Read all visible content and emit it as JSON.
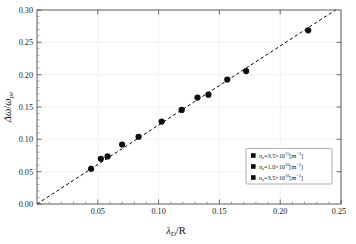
{
  "chart_data": {
    "type": "scatter",
    "title": "",
    "subtitle": "",
    "xlabel": "λ_D/R",
    "ylabel": "Δω/ω_pe",
    "xlim": [
      0.0,
      0.25
    ],
    "ylim": [
      0.0,
      0.3
    ],
    "xticks": [
      "0.05",
      "0.10",
      "0.15",
      "0.20",
      "0.25"
    ],
    "xtick_values": [
      0.05,
      0.1,
      0.15,
      0.2,
      0.25
    ],
    "yticks": [
      "0.00",
      "0.05",
      "0.10",
      "0.15",
      "0.20",
      "0.25",
      "0.30"
    ],
    "ytick_values": [
      0.0,
      0.05,
      0.1,
      0.15,
      0.2,
      0.25,
      0.3
    ],
    "grid": true,
    "legend_position": "lower-right",
    "points": [
      {
        "x": 0.0445,
        "y": 0.0545
      },
      {
        "x": 0.0525,
        "y": 0.07
      },
      {
        "x": 0.058,
        "y": 0.0735
      },
      {
        "x": 0.07,
        "y": 0.092
      },
      {
        "x": 0.0835,
        "y": 0.104
      },
      {
        "x": 0.1025,
        "y": 0.1275
      },
      {
        "x": 0.119,
        "y": 0.1455
      },
      {
        "x": 0.132,
        "y": 0.1645
      },
      {
        "x": 0.141,
        "y": 0.169
      },
      {
        "x": 0.1565,
        "y": 0.1925
      },
      {
        "x": 0.172,
        "y": 0.2055
      },
      {
        "x": 0.223,
        "y": 0.2685
      }
    ],
    "fit_line": {
      "style": "dashed",
      "x_start": 0.0,
      "y_start": 0.0,
      "x_end": 0.2455,
      "y_end": 0.3
    },
    "series": [
      {
        "name": "n_e=3.5×10^15 [m^-3]",
        "symbol": "n",
        "subscript": "e",
        "equals": "=3.5×10",
        "exponent": "15",
        "unit": "[m",
        "unit_exp": "−3",
        "unit_close": "]",
        "marker": "square",
        "color": "#0d0d0d"
      },
      {
        "name": "n_e=1.0×10^16 [m^-3]",
        "symbol": "n",
        "subscript": "e",
        "equals": "=1.0×10",
        "exponent": "16",
        "unit": "[m",
        "unit_exp": "−3",
        "unit_close": "]",
        "marker": "square",
        "color": "#0d0d0d"
      },
      {
        "name": "n_e=3.5×10^16 [m^-3]",
        "symbol": "n",
        "subscript": "e",
        "equals": "=3.5×10",
        "exponent": "16",
        "unit": "[m",
        "unit_exp": "−3",
        "unit_close": "]",
        "marker": "square",
        "color": "#0d0d0d"
      }
    ]
  },
  "axes": {
    "x_title_parts": {
      "lambda": "λ",
      "sub": "D",
      "slash": "/R"
    },
    "y_title_parts": {
      "delta": "Δω",
      "slash": "/",
      "omega": "ω",
      "sub": "pe"
    }
  },
  "colors": {
    "frame": "#4a4a4a",
    "grid": "#eceef1",
    "marker": "#0d0d0d",
    "fit": "#000000",
    "background": "#ffffff"
  }
}
